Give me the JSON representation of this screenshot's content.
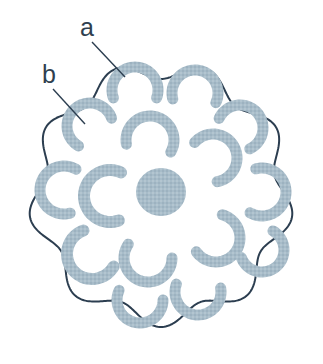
{
  "figure": {
    "background_color": "#ffffff",
    "outline_color": "#2c3e50",
    "fill_color": "#a7bcc9",
    "outline_width": 2,
    "canvas": {
      "width": 323,
      "height": 364
    }
  },
  "labels": [
    {
      "id": "label-a",
      "text": "a",
      "x": 80,
      "y": 36,
      "leader": {
        "x1": 92,
        "y1": 42,
        "x2": 125,
        "y2": 77
      }
    },
    {
      "id": "label-b",
      "text": "b",
      "x": 42,
      "y": 83,
      "leader": {
        "x1": 53,
        "y1": 89,
        "x2": 85,
        "y2": 124
      }
    }
  ],
  "shapes": {
    "outer_boundary": {
      "name": "scalloped-cell-wall",
      "center": {
        "cx": 161,
        "cy": 194
      },
      "radius": 133,
      "lobes": 9,
      "lobe_depth": 18
    },
    "center_body": {
      "name": "central-nucleus",
      "cx": 161,
      "cy": 192,
      "rx": 25,
      "ry": 24
    },
    "crescents": [
      {
        "cx": 135,
        "cy": 90,
        "r": 23,
        "w": 11,
        "start": 160,
        "end": 380
      },
      {
        "cx": 195,
        "cy": 93,
        "r": 23,
        "w": 11,
        "start": 165,
        "end": 385
      },
      {
        "cx": 90,
        "cy": 126,
        "r": 23,
        "w": 11,
        "start": 120,
        "end": 340
      },
      {
        "cx": 240,
        "cy": 128,
        "r": 23,
        "w": 11,
        "start": 205,
        "end": 425
      },
      {
        "cx": 150,
        "cy": 140,
        "r": 24,
        "w": 11,
        "start": 170,
        "end": 390
      },
      {
        "cx": 213,
        "cy": 158,
        "r": 24,
        "w": 11,
        "start": 220,
        "end": 440
      },
      {
        "cx": 64,
        "cy": 190,
        "r": 24,
        "w": 11,
        "start": 75,
        "end": 300
      },
      {
        "cx": 110,
        "cy": 196,
        "r": 26,
        "w": 12,
        "start": 70,
        "end": 295
      },
      {
        "cx": 262,
        "cy": 192,
        "r": 24,
        "w": 11,
        "start": 255,
        "end": 480
      },
      {
        "cx": 216,
        "cy": 238,
        "r": 24,
        "w": 11,
        "start": 285,
        "end": 505
      },
      {
        "cx": 92,
        "cy": 254,
        "r": 25,
        "w": 12,
        "start": 30,
        "end": 250
      },
      {
        "cx": 148,
        "cy": 258,
        "r": 24,
        "w": 11,
        "start": 0,
        "end": 215
      },
      {
        "cx": 262,
        "cy": 250,
        "r": 22,
        "w": 11,
        "start": 300,
        "end": 520
      },
      {
        "cx": 140,
        "cy": 300,
        "r": 23,
        "w": 11,
        "start": 0,
        "end": 205
      },
      {
        "cx": 198,
        "cy": 292,
        "r": 23,
        "w": 11,
        "start": 350,
        "end": 560
      }
    ]
  }
}
